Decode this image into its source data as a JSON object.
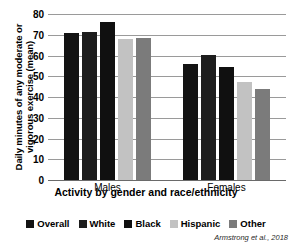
{
  "chart_data": {
    "type": "bar",
    "title": "",
    "xlabel": "Activity by gender and race/ethnicity",
    "ylabel": "Daily minutes of any moderate or vigorous exercise (mean)",
    "categories": [
      "Males",
      "Females"
    ],
    "series": [
      {
        "name": "Overall",
        "color": "#131313",
        "values": [
          71.0,
          56.0
        ]
      },
      {
        "name": "White",
        "color": "#1d1d1d",
        "values": [
          71.2,
          60.2
        ]
      },
      {
        "name": "Black",
        "color": "#101010",
        "values": [
          76.2,
          54.5
        ]
      },
      {
        "name": "Hispanic",
        "color": "#c2c2c2",
        "values": [
          68.2,
          47.2
        ]
      },
      {
        "name": "Other",
        "color": "#7b7b7b",
        "values": [
          68.6,
          44.0
        ]
      }
    ],
    "ylim": [
      0,
      80
    ],
    "ytick_step": 10,
    "yticks": [
      80,
      70,
      60,
      50,
      40,
      30,
      20,
      10,
      0
    ],
    "grid": true,
    "legend_position": "bottom",
    "source_note": "Armstrong et al., 2018"
  }
}
